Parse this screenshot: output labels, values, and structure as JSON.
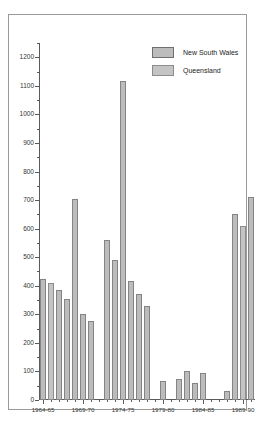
{
  "chart_data": {
    "type": "bar",
    "title": "",
    "subtitle": "",
    "xlabel": "",
    "ylabel": "",
    "ylim": [
      0,
      1250
    ],
    "ytick_step": 100,
    "yminor_step": 50,
    "grid": false,
    "legend_position": "top-right",
    "ytick_labels": [
      "0",
      "100",
      "200",
      "300",
      "400",
      "500",
      "600",
      "700",
      "800",
      "900",
      "1000",
      "1100",
      "1200"
    ],
    "ytick_values": [
      0,
      100,
      200,
      300,
      400,
      500,
      600,
      700,
      800,
      900,
      1000,
      1100,
      1200
    ],
    "xtick_labels": [
      "1964-65",
      "1969-70",
      "1974-75",
      "1979-80",
      "1984-85",
      "1989-90"
    ],
    "xtick_values": [
      1964,
      1969,
      1974,
      1979,
      1984,
      1989
    ],
    "legend": [
      {
        "name": "New South Wales",
        "color": "#bcbcbc"
      },
      {
        "name": "Queensland",
        "color": "#c4c4c4"
      }
    ],
    "x": [
      "1964-65",
      "1965-66",
      "1966-67",
      "1967-68",
      "1968-69",
      "1969-70",
      "1970-71",
      "1971-72",
      "1972-73",
      "1973-74",
      "1974-75",
      "1975-76",
      "1976-77",
      "1977-78",
      "1978-79",
      "1979-80",
      "1980-81",
      "1981-82",
      "1982-83",
      "1983-84",
      "1984-85",
      "1985-86",
      "1986-87",
      "1987-88",
      "1988-89",
      "1989-90",
      "1990-91"
    ],
    "series": [
      {
        "name": "New South Wales",
        "color": "#bcbcbc",
        "values": [
          425,
          385,
          355,
          705,
          300,
          278,
          0,
          0,
          560,
          490,
          1118,
          415,
          370,
          330,
          0,
          0,
          65,
          0,
          75,
          100,
          60,
          95,
          0,
          0,
          30,
          650,
          710
        ]
      },
      {
        "name": "Queensland",
        "color": "#c4c4c4",
        "values": [
          408,
          0,
          0,
          0,
          0,
          0,
          0,
          0,
          0,
          0,
          0,
          0,
          0,
          0,
          0,
          0,
          0,
          0,
          0,
          0,
          0,
          0,
          0,
          0,
          0,
          608,
          0
        ]
      }
    ],
    "bars": [
      {
        "pos": 0,
        "value": 425,
        "series": "New South Wales"
      },
      {
        "pos": 1,
        "value": 408,
        "series": "Queensland"
      },
      {
        "pos": 2,
        "value": 385,
        "series": "New South Wales"
      },
      {
        "pos": 3,
        "value": 355,
        "series": "New South Wales"
      },
      {
        "pos": 4,
        "value": 705,
        "series": "New South Wales"
      },
      {
        "pos": 5,
        "value": 300,
        "series": "New South Wales"
      },
      {
        "pos": 6,
        "value": 278,
        "series": "New South Wales"
      },
      {
        "pos": 8,
        "value": 560,
        "series": "New South Wales"
      },
      {
        "pos": 9,
        "value": 490,
        "series": "New South Wales"
      },
      {
        "pos": 10,
        "value": 1118,
        "series": "New South Wales"
      },
      {
        "pos": 11,
        "value": 415,
        "series": "New South Wales"
      },
      {
        "pos": 12,
        "value": 370,
        "series": "New South Wales"
      },
      {
        "pos": 13,
        "value": 330,
        "series": "New South Wales"
      },
      {
        "pos": 15,
        "value": 65,
        "series": "New South Wales"
      },
      {
        "pos": 17,
        "value": 75,
        "series": "New South Wales"
      },
      {
        "pos": 18,
        "value": 100,
        "series": "New South Wales"
      },
      {
        "pos": 19,
        "value": 60,
        "series": "New South Wales"
      },
      {
        "pos": 20,
        "value": 95,
        "series": "New South Wales"
      },
      {
        "pos": 23,
        "value": 30,
        "series": "New South Wales"
      },
      {
        "pos": 24,
        "value": 650,
        "series": "New South Wales"
      },
      {
        "pos": 25,
        "value": 608,
        "series": "Queensland"
      },
      {
        "pos": 26,
        "value": 710,
        "series": "New South Wales"
      }
    ]
  }
}
